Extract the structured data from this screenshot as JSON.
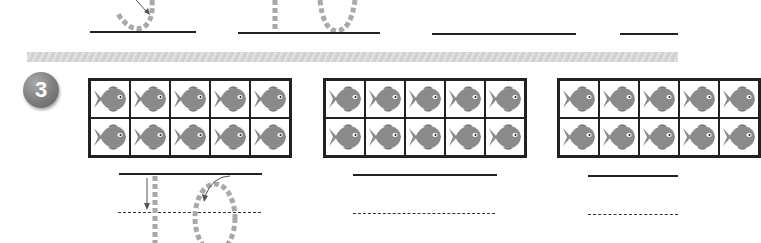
{
  "worksheet": {
    "exercise_number": "3",
    "colors": {
      "fish": "#8a8a8a",
      "frame_border": "#222222",
      "trace_dashes": "#a8a8a8",
      "badge": "#7d7d7d"
    },
    "top_row": {
      "traced_digits": [
        "5",
        "10"
      ],
      "answer_lines": 4
    },
    "ten_frames": [
      {
        "rows": 2,
        "cols": 5,
        "fish_count": 10,
        "traced_answer": "10"
      },
      {
        "rows": 2,
        "cols": 5,
        "fish_count": 10,
        "traced_answer": ""
      },
      {
        "rows": 2,
        "cols": 5,
        "fish_count": 10,
        "traced_answer": ""
      }
    ],
    "icons": {
      "counter": "fish-icon",
      "stroke_direction": "arrow-icon"
    }
  }
}
